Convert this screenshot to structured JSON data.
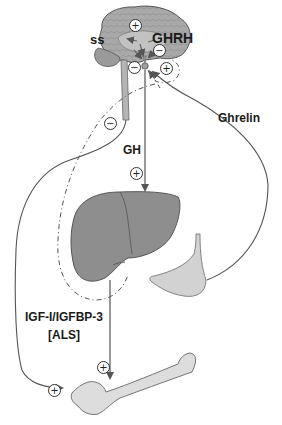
{
  "diagram": {
    "type": "endocrine-axis",
    "labels": {
      "ss": "ss",
      "ghrh": "GHRH",
      "gh": "GH",
      "ghrelin": "Ghrelin",
      "igf_line1": "IGF-I/IGFBP-3",
      "igf_line2": "[ALS]"
    },
    "signs": {
      "brain_top": "+",
      "ghrh_neg": "−",
      "pituitary_left_neg": "−",
      "pituitary_right_pos": "+",
      "feedback_neg": "−",
      "gh_pos": "+",
      "igf_pos": "+",
      "bone_pos": "+"
    },
    "organs": [
      "brain",
      "pituitary",
      "liver",
      "stomach",
      "bone"
    ],
    "colors": {
      "arrow": "#555555",
      "liver": "#8c8c8c",
      "brain": "#a8a8a8",
      "stomach": "#d4d4d4",
      "bone": "#dcdcdc"
    }
  }
}
